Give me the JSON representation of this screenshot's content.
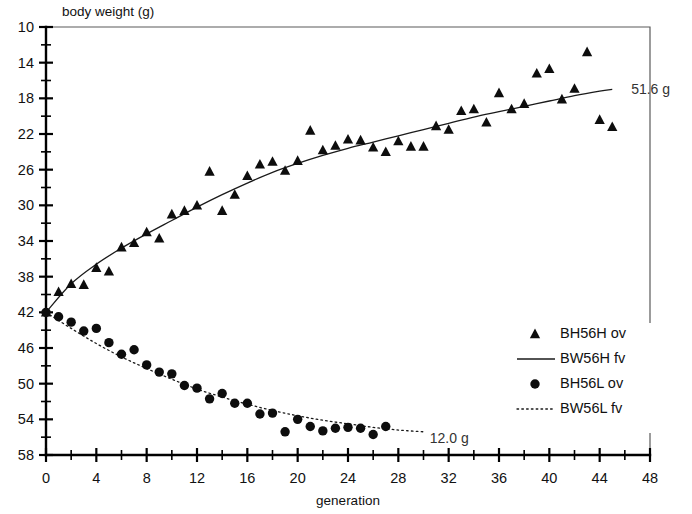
{
  "chart_data": {
    "type": "scatter",
    "title": "",
    "xlabel": "generation",
    "ylabel": "body weight (g)",
    "xlim": [
      0,
      48
    ],
    "ylim": [
      10,
      58
    ],
    "x_major_ticks": [
      0,
      4,
      8,
      12,
      16,
      20,
      24,
      28,
      32,
      36,
      40,
      44,
      48
    ],
    "x_minor_step": 2,
    "y_major_ticks": [
      10,
      14,
      18,
      22,
      26,
      30,
      34,
      38,
      42,
      46,
      50,
      54,
      58
    ],
    "y_minor_step": 2,
    "grid": false,
    "legend_position": "right-middle",
    "annotations": [
      {
        "name": "high-line-asymptote",
        "text": "51.6 g",
        "x": 46.5,
        "y": 51.0
      },
      {
        "name": "low-line-asymptote",
        "text": "12.0 g",
        "x": 30.5,
        "y": 11.9
      }
    ],
    "series": [
      {
        "name": "BH56H ov",
        "marker": "triangle",
        "type": "scatter",
        "points": [
          [
            0,
            26.0
          ],
          [
            1,
            28.3
          ],
          [
            2,
            29.2
          ],
          [
            3,
            29.1
          ],
          [
            4,
            31.0
          ],
          [
            5,
            30.6
          ],
          [
            6,
            33.3
          ],
          [
            7,
            33.8
          ],
          [
            8,
            35.0
          ],
          [
            9,
            34.3
          ],
          [
            10,
            37.0
          ],
          [
            11,
            37.4
          ],
          [
            12,
            38.0
          ],
          [
            13,
            41.8
          ],
          [
            14,
            37.4
          ],
          [
            15,
            39.2
          ],
          [
            16,
            41.3
          ],
          [
            17,
            42.6
          ],
          [
            18,
            42.9
          ],
          [
            19,
            41.9
          ],
          [
            20,
            43.0
          ],
          [
            21,
            46.4
          ],
          [
            22,
            44.2
          ],
          [
            23,
            44.7
          ],
          [
            24,
            45.4
          ],
          [
            25,
            45.3
          ],
          [
            26,
            44.5
          ],
          [
            27,
            44.0
          ],
          [
            28,
            45.2
          ],
          [
            29,
            44.6
          ],
          [
            30,
            44.6
          ],
          [
            31,
            46.9
          ],
          [
            32,
            46.5
          ],
          [
            33,
            48.6
          ],
          [
            34,
            48.8
          ],
          [
            35,
            47.3
          ],
          [
            36,
            50.6
          ],
          [
            37,
            48.8
          ],
          [
            38,
            49.4
          ],
          [
            39,
            52.8
          ],
          [
            40,
            53.3
          ],
          [
            41,
            49.9
          ],
          [
            42,
            51.1
          ],
          [
            43,
            55.2
          ],
          [
            44,
            47.6
          ],
          [
            45,
            46.8
          ]
        ]
      },
      {
        "name": "BW56H fv",
        "marker": "line-solid",
        "type": "line",
        "points": [
          [
            0,
            26.0
          ],
          [
            2,
            29.2
          ],
          [
            4,
            31.4
          ],
          [
            6,
            33.2
          ],
          [
            8,
            34.8
          ],
          [
            10,
            36.3
          ],
          [
            12,
            37.8
          ],
          [
            14,
            39.2
          ],
          [
            16,
            40.5
          ],
          [
            18,
            41.7
          ],
          [
            20,
            42.7
          ],
          [
            22,
            43.6
          ],
          [
            24,
            44.4
          ],
          [
            26,
            45.1
          ],
          [
            28,
            45.8
          ],
          [
            30,
            46.5
          ],
          [
            32,
            47.2
          ],
          [
            34,
            47.9
          ],
          [
            36,
            48.5
          ],
          [
            38,
            49.1
          ],
          [
            40,
            49.7
          ],
          [
            42,
            50.3
          ],
          [
            44,
            50.8
          ],
          [
            45,
            51.0
          ]
        ]
      },
      {
        "name": "BH56L ov",
        "marker": "circle",
        "type": "scatter",
        "points": [
          [
            0,
            26.0
          ],
          [
            1,
            25.5
          ],
          [
            2,
            24.9
          ],
          [
            3,
            23.9
          ],
          [
            4,
            24.2
          ],
          [
            5,
            22.6
          ],
          [
            6,
            21.3
          ],
          [
            7,
            21.8
          ],
          [
            8,
            20.1
          ],
          [
            9,
            19.3
          ],
          [
            10,
            19.1
          ],
          [
            11,
            17.8
          ],
          [
            12,
            17.5
          ],
          [
            13,
            16.3
          ],
          [
            14,
            16.9
          ],
          [
            15,
            15.8
          ],
          [
            16,
            15.8
          ],
          [
            17,
            14.6
          ],
          [
            18,
            14.7
          ],
          [
            19,
            12.6
          ],
          [
            20,
            14.0
          ],
          [
            21,
            13.2
          ],
          [
            22,
            12.7
          ],
          [
            23,
            13.0
          ],
          [
            24,
            13.1
          ],
          [
            25,
            13.0
          ],
          [
            26,
            12.3
          ],
          [
            27,
            13.2
          ]
        ]
      },
      {
        "name": "BW56L fv",
        "marker": "line-dotted",
        "type": "line",
        "points": [
          [
            0,
            26.0
          ],
          [
            2,
            24.2
          ],
          [
            4,
            22.5
          ],
          [
            6,
            21.0
          ],
          [
            8,
            19.7
          ],
          [
            10,
            18.5
          ],
          [
            12,
            17.4
          ],
          [
            14,
            16.5
          ],
          [
            16,
            15.7
          ],
          [
            18,
            15.0
          ],
          [
            20,
            14.4
          ],
          [
            22,
            13.9
          ],
          [
            24,
            13.5
          ],
          [
            26,
            13.1
          ],
          [
            28,
            12.8
          ],
          [
            30,
            12.6
          ]
        ]
      }
    ]
  },
  "axes": {
    "y_title": "body weight (g)",
    "x_title": "generation",
    "y_tick_labels": [
      "58",
      "54",
      "50",
      "46",
      "42",
      "38",
      "34",
      "30",
      "26",
      "22",
      "18",
      "14",
      "10"
    ],
    "x_tick_labels": [
      "0",
      "4",
      "8",
      "12",
      "16",
      "20",
      "24",
      "28",
      "32",
      "36",
      "40",
      "44",
      "48"
    ]
  },
  "legend": {
    "items": [
      {
        "label": "BH56H ov",
        "symbol": "triangle"
      },
      {
        "label": "BW56H fv",
        "symbol": "line-solid"
      },
      {
        "label": "BH56L ov",
        "symbol": "circle"
      },
      {
        "label": "BW56L fv",
        "symbol": "line-dotted"
      }
    ]
  },
  "colors": {
    "marker": "#0d0d0d",
    "axis": "#000000",
    "frame": "#5a5a5a",
    "annotation": "#333333",
    "background": "#ffffff"
  }
}
